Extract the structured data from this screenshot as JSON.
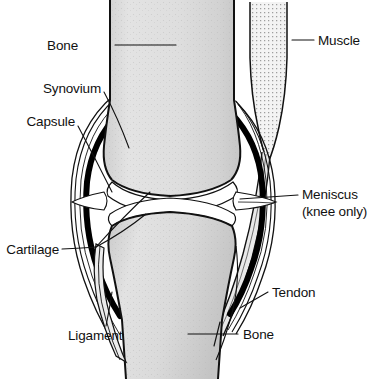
{
  "figure": {
    "background_color": "#ffffff",
    "line_color": "#111111",
    "bone_fill": "#dcdcdc",
    "bone_fill_light": "#e8e8e8",
    "cartilage_fill": "#ffffff",
    "muscle_fill": "#f2f2f2",
    "synovium_color": "#000000"
  },
  "labels": {
    "bone_top": "Bone",
    "synovium": "Synovium",
    "capsule": "Capsule",
    "muscle": "Muscle",
    "meniscus_line1": "Meniscus",
    "meniscus_line2": "(knee only)",
    "cartilage": "Cartilage",
    "tendon": "Tendon",
    "ligament": "Ligament",
    "bone_bottom": "Bone"
  },
  "structures": [
    {
      "name": "femur",
      "label": "Bone",
      "position": "upper-center"
    },
    {
      "name": "tibia",
      "label": "Bone",
      "position": "lower-center"
    },
    {
      "name": "muscle",
      "label": "Muscle",
      "position": "upper-right"
    },
    {
      "name": "synovium",
      "label": "Synovium",
      "position": "left-joint"
    },
    {
      "name": "capsule",
      "label": "Capsule",
      "position": "left-joint-outer"
    },
    {
      "name": "meniscus",
      "label": "Meniscus (knee only)",
      "position": "right-joint"
    },
    {
      "name": "cartilage",
      "label": "Cartilage",
      "position": "joint-space"
    },
    {
      "name": "tendon",
      "label": "Tendon",
      "position": "lower-right"
    },
    {
      "name": "ligament",
      "label": "Ligament",
      "position": "lower-left"
    }
  ]
}
